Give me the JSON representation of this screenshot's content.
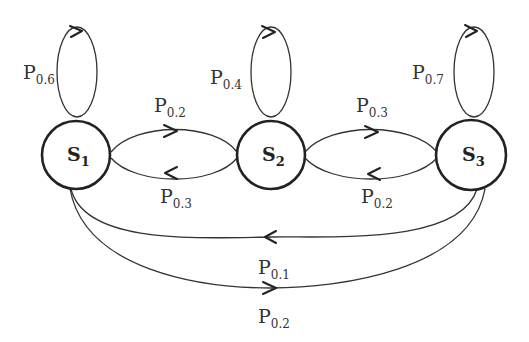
{
  "states": [
    {
      "id": "S1",
      "base": "S",
      "sub": "1"
    },
    {
      "id": "S2",
      "base": "S",
      "sub": "2"
    },
    {
      "id": "S3",
      "base": "S",
      "sub": "3"
    }
  ],
  "transitions": [
    {
      "from": "S1",
      "to": "S1",
      "base": "P",
      "sub": "0.6"
    },
    {
      "from": "S2",
      "to": "S2",
      "base": "P",
      "sub": "0.4"
    },
    {
      "from": "S3",
      "to": "S3",
      "base": "P",
      "sub": "0.7"
    },
    {
      "from": "S1",
      "to": "S2",
      "base": "P",
      "sub": "0.2"
    },
    {
      "from": "S2",
      "to": "S1",
      "base": "P",
      "sub": "0.3"
    },
    {
      "from": "S2",
      "to": "S3",
      "base": "P",
      "sub": "0.3"
    },
    {
      "from": "S3",
      "to": "S2",
      "base": "P",
      "sub": "0.2"
    },
    {
      "from": "S3",
      "to": "S1",
      "base": "P",
      "sub": "0.1"
    },
    {
      "from": "S1",
      "to": "S3",
      "base": "P",
      "sub": "0.2"
    }
  ]
}
